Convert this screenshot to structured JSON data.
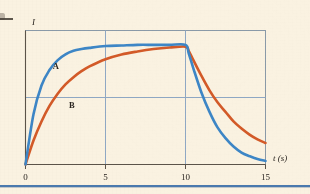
{
  "figure": {
    "background_color": "#faf2e1",
    "bottom_rule_color": "#4a79ad"
  },
  "chart_data": {
    "type": "line",
    "title": "",
    "subtitle": "",
    "xlabel": "t (s)",
    "ylabel": "I",
    "xticks": [
      "0",
      "5",
      "10",
      "15"
    ],
    "xtick_values": [
      0,
      5,
      10,
      15
    ],
    "yticks": [],
    "xlim": [
      0,
      15
    ],
    "ylim": [
      0,
      1.12
    ],
    "grid": "major gridlines at t=5, t=10 and one horizontal midline",
    "gridline_color": "#8fa8c4",
    "frame_color": "#8a9aa8",
    "legend_position": "inline curve labels",
    "annotations": [
      {
        "text": "A",
        "series": "A",
        "x": 1.9,
        "y": 0.8
      },
      {
        "text": "B",
        "series": "B",
        "x": 2.9,
        "y": 0.47
      }
    ],
    "series": [
      {
        "name": "A",
        "label": "A",
        "color": "#3d86c6",
        "description": "fast-rising exponential charge to plateau, then fast exponential decay after t=10",
        "x": [
          0,
          0.5,
          1,
          1.5,
          2,
          2.5,
          3,
          3.5,
          4,
          5,
          6,
          7,
          8,
          9,
          10,
          10.2,
          10.5,
          11,
          11.5,
          12,
          12.5,
          13,
          13.5,
          14,
          14.5,
          15
        ],
        "y": [
          0,
          0.42,
          0.66,
          0.79,
          0.87,
          0.92,
          0.95,
          0.965,
          0.975,
          0.99,
          0.995,
          1.0,
          1.0,
          1.0,
          1.0,
          0.93,
          0.8,
          0.6,
          0.44,
          0.31,
          0.22,
          0.15,
          0.1,
          0.07,
          0.045,
          0.03
        ]
      },
      {
        "name": "B",
        "label": "B",
        "color": "#d35a28",
        "description": "slower-rising exponential charge to plateau, then slower exponential decay after t=10",
        "x": [
          0,
          0.5,
          1,
          1.5,
          2,
          2.5,
          3,
          3.5,
          4,
          5,
          6,
          7,
          8,
          9,
          10,
          10.2,
          10.5,
          11,
          11.5,
          12,
          12.5,
          13,
          13.5,
          14,
          14.5,
          15
        ],
        "y": [
          0,
          0.2,
          0.36,
          0.49,
          0.59,
          0.67,
          0.73,
          0.78,
          0.82,
          0.88,
          0.92,
          0.945,
          0.965,
          0.978,
          0.985,
          0.95,
          0.87,
          0.74,
          0.62,
          0.52,
          0.44,
          0.36,
          0.3,
          0.25,
          0.21,
          0.18
        ]
      }
    ]
  }
}
